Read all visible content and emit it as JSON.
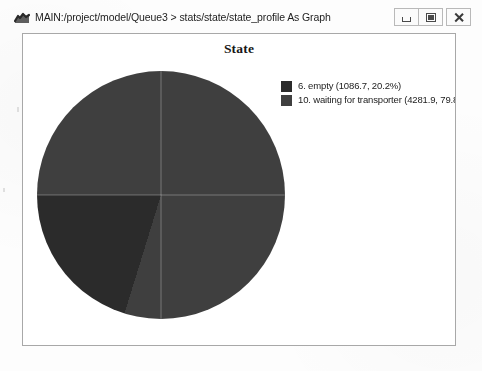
{
  "window": {
    "title": "MAIN:/project/model/Queue3 > stats/state/state_profile As Graph",
    "app_icon": "chart-app-icon",
    "controls": {
      "minimize": "Minimize",
      "maximize": "Maximize",
      "close": "Close"
    }
  },
  "chart_data": {
    "type": "pie",
    "title": "State",
    "xlabel": "",
    "ylabel": "",
    "legend_position": "right",
    "grid": false,
    "categories": [
      "6. empty",
      "10. waiting for transporter"
    ],
    "values": [
      1086.7,
      4281.9
    ],
    "percentages": [
      20.2,
      79.8
    ],
    "colors": [
      "#2b2b2b",
      "#3f3f3f"
    ],
    "start_angle_deg": 0,
    "direction": "counterclockwise",
    "slices": [
      {
        "label": "6. empty",
        "value": 1086.7,
        "percent": 20.2,
        "color": "#2b2b2b",
        "legend_text": "6. empty (1086.7, 20.2%)"
      },
      {
        "label": "10. waiting for transporter",
        "value": 4281.9,
        "percent": 79.8,
        "color": "#3f3f3f",
        "legend_text": "10. waiting for transporter (4281.9, 79.8"
      }
    ]
  }
}
